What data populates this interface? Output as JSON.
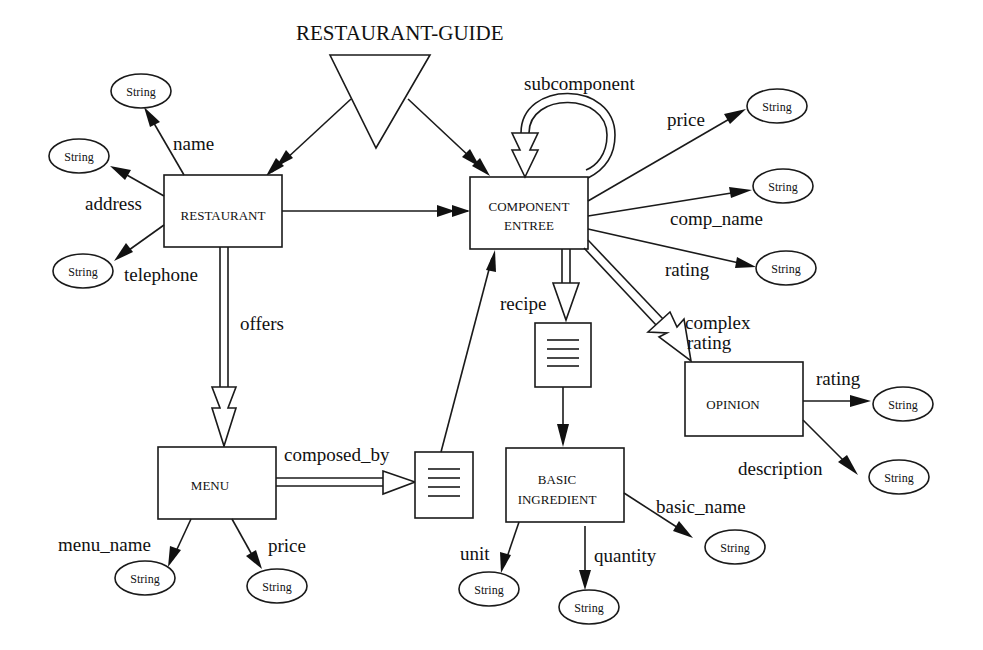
{
  "diagram": {
    "title": "RESTAURANT-GUIDE",
    "entities": {
      "restaurant": "RESTAURANT",
      "component_entree_1": "COMPONENT",
      "component_entree_2": "ENTREE",
      "menu": "MENU",
      "basic_ingredient_1": "BASIC",
      "basic_ingredient_2": "INGREDIENT",
      "opinion": "OPINION"
    },
    "attribute_type": "String",
    "edges": {
      "name": "name",
      "address": "address",
      "telephone": "telephone",
      "offers": "offers",
      "composed_by": "composed_by",
      "menu_name": "menu_name",
      "menu_price": "price",
      "subcomponent": "subcomponent",
      "comp_price": "price",
      "comp_name": "comp_name",
      "comp_rating": "rating",
      "recipe": "recipe",
      "complex_rating_1": "complex",
      "complex_rating_2": "rating",
      "opinion_rating": "rating",
      "description": "description",
      "basic_name": "basic_name",
      "unit": "unit",
      "quantity": "quantity"
    }
  }
}
